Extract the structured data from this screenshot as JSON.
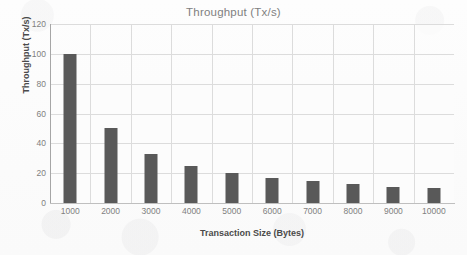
{
  "chart_data": {
    "type": "bar",
    "title": "Throughput (Tx/s)",
    "xlabel": "Transaction Size (Bytes)",
    "ylabel": "Throughput (Tx/s)",
    "categories": [
      "1000",
      "2000",
      "3000",
      "4000",
      "5000",
      "6000",
      "7000",
      "8000",
      "9000",
      "10000"
    ],
    "values": [
      100,
      50,
      33,
      25,
      20,
      17,
      15,
      13,
      11,
      10
    ],
    "ylim": [
      0,
      120
    ],
    "yticks": [
      "0",
      "20",
      "40",
      "60",
      "80",
      "100",
      "120"
    ],
    "ytick_values": [
      0,
      20,
      40,
      60,
      80,
      100,
      120
    ],
    "grid": "horizontal-and-vertical",
    "legend": "none",
    "series": [
      {
        "name": "Throughput",
        "values": [
          100,
          50,
          33,
          25,
          20,
          17,
          15,
          13,
          11,
          10
        ]
      }
    ],
    "colors": {
      "bar": "#595959",
      "gridline": "#dcdcdc",
      "axis_line": "#a6a6a6",
      "title_text": "#808080",
      "tick_text": "#7f7f7f",
      "axis_title_text": "#4a4a4a",
      "plot_background": "#fcfcfc"
    }
  }
}
